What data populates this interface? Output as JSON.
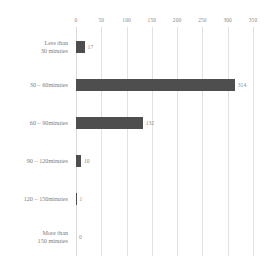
{
  "chart_data": {
    "type": "bar",
    "orientation": "horizontal",
    "title": "",
    "subtitle": "",
    "xlabel": "",
    "ylabel": "",
    "xlim": [
      0,
      350
    ],
    "grid": "vertical",
    "legend": "none",
    "accent_color": "#4e4e4e",
    "label_color": "#7d7d7d",
    "gridline_color": "#e2e2e2",
    "value_label_color": "#8c8c8c",
    "xticks": [
      0,
      50,
      100,
      150,
      200,
      250,
      300,
      350
    ],
    "xtick_labels": [
      "0",
      "50",
      "100",
      "150",
      "200",
      "250",
      "300",
      "350"
    ],
    "categories": [
      "Less than\n30 minutes",
      "30 – 60minutes",
      "60 – 90minutes",
      "90 – 120minutes",
      "120 – 150minutes",
      "More than\n150 minutes"
    ],
    "values": [
      17,
      314,
      132,
      10,
      1,
      0
    ],
    "value_labels": [
      "17",
      "314",
      "132",
      "10",
      "1",
      "0"
    ]
  }
}
